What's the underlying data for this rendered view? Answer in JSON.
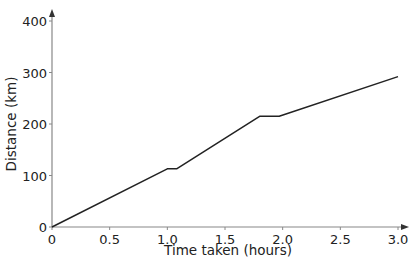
{
  "chart_data": {
    "type": "line",
    "title": "",
    "xlabel": "Time taken (hours)",
    "ylabel": "Distance (km)",
    "xlim": [
      0,
      3.0
    ],
    "ylim": [
      0,
      400
    ],
    "xticks": [
      0,
      0.5,
      1.0,
      1.5,
      2.0,
      2.5,
      3.0
    ],
    "xtick_labels": [
      "0",
      "0.5",
      "1.0",
      "1.5",
      "2.0",
      "2.5",
      "3.0"
    ],
    "yticks": [
      0,
      100,
      200,
      300,
      400
    ],
    "ytick_labels": [
      "0",
      "100",
      "200",
      "300",
      "400"
    ],
    "grid": false,
    "legend": null,
    "series": [
      {
        "name": "Journey",
        "x": [
          0,
          1.0,
          1.08,
          1.8,
          1.97,
          3.0
        ],
        "y": [
          0,
          113,
          113,
          215,
          215,
          292
        ]
      }
    ],
    "line_color": "#222222",
    "axis_color": "#888888"
  }
}
